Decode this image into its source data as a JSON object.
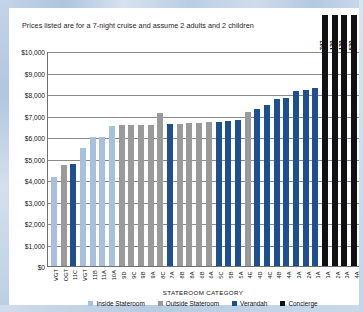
{
  "note": "Prices listed are for a 7-night cruise and assume 2 adults and 2 children",
  "chart_data": {
    "type": "bar",
    "title": "",
    "xlabel": "STATEROOM CATEGORY",
    "ylabel": "",
    "ylim": [
      0,
      10000
    ],
    "ytick_labels": [
      "$10,000",
      "$9,000",
      "$8,000",
      "$7,000",
      "$6,000",
      "$5,000",
      "$4,000",
      "$3,000",
      "$2,000",
      "$1,000",
      "$0"
    ],
    "ytick_values": [
      10000,
      9000,
      8000,
      7000,
      6000,
      5000,
      4000,
      3000,
      2000,
      1000,
      0
    ],
    "grid": true,
    "legend_position": "bottom",
    "legend": [
      {
        "label": "Inside Stateroom",
        "color": "#a8c0dd"
      },
      {
        "label": "Outside Stateroom",
        "color": "#9a9a9a"
      },
      {
        "label": "Verandah",
        "color": "#1d4f91"
      },
      {
        "label": "Concierge",
        "color": "#101015"
      }
    ],
    "categories": [
      "VGT",
      "OGT",
      "11C",
      "VGT",
      "11B",
      "11A",
      "10A",
      "9D",
      "9C",
      "9B",
      "9A",
      "8C",
      "7A",
      "8B",
      "8A",
      "6B",
      "6A",
      "5C",
      "5B",
      "5A",
      "4E",
      "4D",
      "4C",
      "4B",
      "4A",
      "3A",
      "2A",
      "1A",
      "1A",
      "2A",
      "3A",
      "4A"
    ],
    "series_colors": [
      "inside",
      "outside",
      "verandah",
      "inside",
      "inside",
      "inside",
      "inside",
      "outside",
      "outside",
      "outside",
      "outside",
      "outside",
      "verandah",
      "outside",
      "outside",
      "outside",
      "outside",
      "verandah",
      "verandah",
      "verandah",
      "outside",
      "verandah",
      "verandah",
      "verandah",
      "verandah",
      "verandah",
      "verandah",
      "verandah",
      "concierge",
      "concierge",
      "concierge",
      "concierge"
    ],
    "values": [
      4120,
      4720,
      4760,
      5480,
      6000,
      6020,
      6520,
      6540,
      6560,
      6560,
      6580,
      7100,
      6600,
      6620,
      6640,
      6660,
      6680,
      6720,
      6760,
      6800,
      7180,
      7280,
      7500,
      7780,
      7820,
      8120,
      8200,
      8300,
      14747,
      22130,
      22130,
      39530
    ],
    "top_labels": [
      "$14,747",
      "$22,130",
      "$22,130",
      "$39,530"
    ],
    "top_label_indices": [
      28,
      29,
      30,
      31
    ]
  }
}
